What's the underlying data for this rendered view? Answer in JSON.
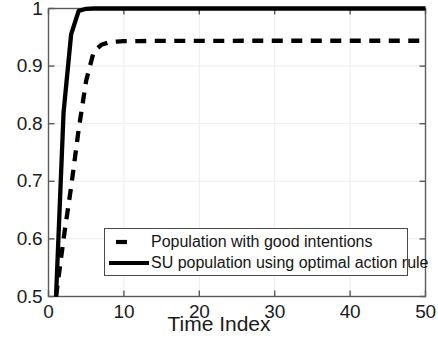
{
  "chart_data": {
    "type": "line",
    "title": "",
    "xlabel": "Time Index",
    "ylabel": "Percentage",
    "xlim": [
      0,
      50
    ],
    "ylim": [
      0.5,
      1.0
    ],
    "xticks": [
      "0",
      "10",
      "20",
      "30",
      "40",
      "50"
    ],
    "xtick_values": [
      0,
      10,
      20,
      30,
      40,
      50
    ],
    "yticks": [
      "0.5",
      "0.6",
      "0.7",
      "0.8",
      "0.9",
      "1"
    ],
    "ytick_values": [
      0.5,
      0.6,
      0.7,
      0.8,
      0.9,
      1.0
    ],
    "grid": true,
    "legend_position": "lower center",
    "x": [
      1,
      2,
      3,
      4,
      5,
      6,
      7,
      8,
      9,
      10,
      12,
      14,
      16,
      18,
      20,
      22,
      24,
      26,
      28,
      30,
      32,
      34,
      36,
      38,
      40,
      42,
      44,
      46,
      48,
      50
    ],
    "series": [
      {
        "name": "Population with good intentions",
        "style": "dashed",
        "color": "#000000",
        "values": [
          0.5,
          0.6,
          0.69,
          0.79,
          0.875,
          0.925,
          0.937,
          0.941,
          0.9425,
          0.9432,
          0.9435,
          0.9437,
          0.9438,
          0.9438,
          0.9439,
          0.9439,
          0.9439,
          0.944,
          0.944,
          0.944,
          0.944,
          0.944,
          0.944,
          0.944,
          0.944,
          0.944,
          0.944,
          0.944,
          0.944,
          0.944
        ]
      },
      {
        "name": "SU population using optimal action rule",
        "style": "solid",
        "color": "#000000",
        "values": [
          0.5,
          0.82,
          0.955,
          0.996,
          0.9995,
          1.0,
          1.0,
          1.0,
          1.0,
          1.0,
          1.0,
          1.0,
          1.0,
          1.0,
          1.0,
          1.0,
          1.0,
          1.0,
          1.0,
          1.0,
          1.0,
          1.0,
          1.0,
          1.0,
          1.0,
          1.0,
          1.0,
          1.0,
          1.0,
          1.0
        ]
      }
    ]
  }
}
